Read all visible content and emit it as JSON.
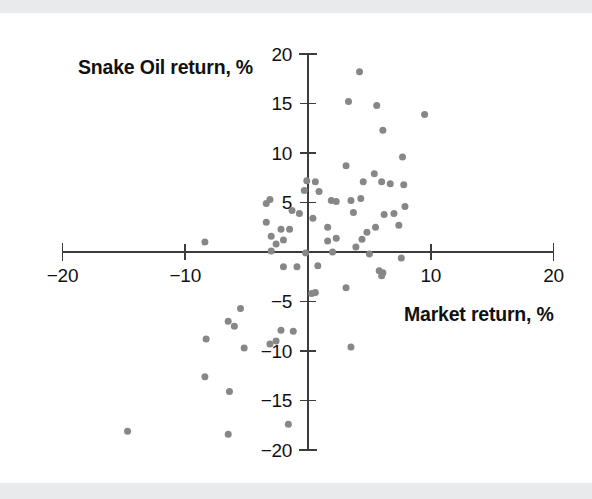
{
  "figure": {
    "background_color": "#ffffff",
    "band_color": "#e9eaec",
    "point_color": "#878787",
    "axis_color": "#3c3c3c"
  },
  "chart_data": {
    "type": "scatter",
    "title": "",
    "xlabel": "Market return, %",
    "ylabel": "Snake Oil return, %",
    "xlim": [
      -20,
      20
    ],
    "ylim": [
      -20,
      20
    ],
    "xticks": [
      -20,
      -10,
      10,
      20
    ],
    "xtick_labels": [
      "−20",
      "−10",
      "10",
      "20"
    ],
    "yticks": [
      20,
      15,
      10,
      5,
      -5,
      -10,
      -15,
      -20
    ],
    "ytick_labels": [
      "20",
      "15",
      "10",
      "5",
      "−5",
      "−10",
      "−15",
      "−20"
    ],
    "grid": false,
    "legend": null,
    "axes_style": "crossed-at-origin",
    "marker": "circle",
    "marker_size_px": 7,
    "n_points": 73,
    "points": [
      [
        4.2,
        18.2
      ],
      [
        3.3,
        15.2
      ],
      [
        5.6,
        14.8
      ],
      [
        9.5,
        13.9
      ],
      [
        6.1,
        12.3
      ],
      [
        7.7,
        9.6
      ],
      [
        3.1,
        8.7
      ],
      [
        5.4,
        7.9
      ],
      [
        4.5,
        7.1
      ],
      [
        6.0,
        7.1
      ],
      [
        7.8,
        6.8
      ],
      [
        -0.1,
        7.2
      ],
      [
        0.6,
        7.1
      ],
      [
        -3.1,
        5.3
      ],
      [
        -3.4,
        4.9
      ],
      [
        1.9,
        5.2
      ],
      [
        3.5,
        5.2
      ],
      [
        4.3,
        5.4
      ],
      [
        2.3,
        5.1
      ],
      [
        -1.3,
        4.2
      ],
      [
        -0.7,
        3.9
      ],
      [
        3.7,
        4.0
      ],
      [
        6.2,
        3.8
      ],
      [
        7.0,
        3.9
      ],
      [
        7.4,
        2.7
      ],
      [
        -3.4,
        3.0
      ],
      [
        -2.2,
        2.3
      ],
      [
        1.6,
        2.5
      ],
      [
        5.5,
        2.5
      ],
      [
        -2.0,
        1.2
      ],
      [
        1.6,
        1.1
      ],
      [
        3.9,
        0.5
      ],
      [
        7.6,
        -0.6
      ],
      [
        -2.0,
        -1.5
      ],
      [
        -0.9,
        -1.5
      ],
      [
        0.8,
        -1.4
      ],
      [
        5.8,
        -1.9
      ],
      [
        6.1,
        -2.1
      ],
      [
        6.0,
        -2.4
      ],
      [
        0.3,
        -4.2
      ],
      [
        0.6,
        -4.1
      ],
      [
        3.1,
        -3.6
      ],
      [
        -5.5,
        -5.7
      ],
      [
        -6.5,
        -7.0
      ],
      [
        -6.0,
        -7.5
      ],
      [
        -2.2,
        -7.9
      ],
      [
        -1.2,
        -8.0
      ],
      [
        -8.3,
        -8.8
      ],
      [
        -2.6,
        -9.0
      ],
      [
        -3.1,
        -9.3
      ],
      [
        -5.2,
        -9.7
      ],
      [
        3.5,
        -9.6
      ],
      [
        -8.4,
        -12.6
      ],
      [
        -6.4,
        -14.1
      ],
      [
        -1.6,
        -17.4
      ],
      [
        -14.7,
        -18.1
      ],
      [
        -6.5,
        -18.4
      ],
      [
        -8.4,
        1.0
      ],
      [
        -2.6,
        0.8
      ],
      [
        -3.0,
        0.1
      ],
      [
        2.0,
        0.0
      ],
      [
        5.0,
        -0.2
      ],
      [
        2.3,
        1.4
      ],
      [
        4.4,
        1.3
      ],
      [
        -0.2,
        -0.1
      ],
      [
        4.8,
        2.0
      ],
      [
        0.4,
        3.4
      ],
      [
        -1.5,
        2.3
      ],
      [
        -3.0,
        1.6
      ],
      [
        6.7,
        6.9
      ],
      [
        -0.3,
        6.2
      ],
      [
        0.9,
        6.1
      ],
      [
        7.9,
        4.6
      ]
    ]
  }
}
